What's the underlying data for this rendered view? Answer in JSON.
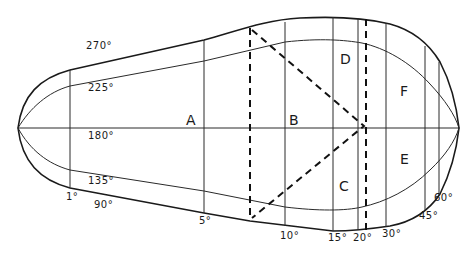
{
  "diagram": {
    "outer_curve_labels": {
      "top": "270°",
      "bottom": "90°"
    },
    "inner_curve_labels": {
      "top": "225°",
      "bottom": "135°"
    },
    "axis_label": "180°",
    "meridian_labels": [
      "1°",
      "5°",
      "10°",
      "15°",
      "20°",
      "30°",
      "45°",
      "60°"
    ],
    "regions": [
      "A",
      "B",
      "C",
      "D",
      "E",
      "F"
    ]
  }
}
